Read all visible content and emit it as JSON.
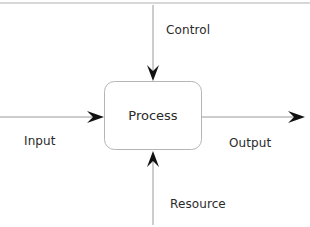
{
  "diagram": {
    "type": "IDEF0 function box",
    "process": {
      "label": "Process"
    },
    "arrows": {
      "control": {
        "label": "Control",
        "direction": "down",
        "side": "top"
      },
      "input": {
        "label": "Input",
        "direction": "right",
        "side": "left"
      },
      "output": {
        "label": "Output",
        "direction": "right",
        "side": "right"
      },
      "resource": {
        "label": "Resource",
        "direction": "up",
        "side": "bottom"
      }
    },
    "colors": {
      "line": "#9a9a9a",
      "box_stroke": "#b5b5b5",
      "arrowhead": "#111111",
      "text": "#2a2a2a",
      "background": "#ffffff"
    }
  }
}
